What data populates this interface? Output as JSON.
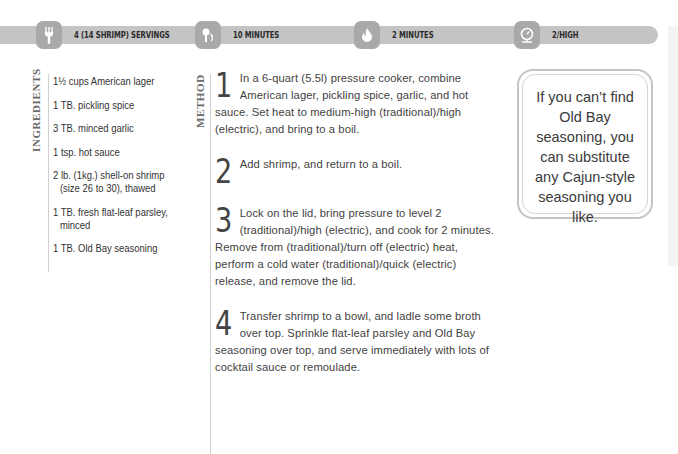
{
  "header": {
    "items": [
      {
        "icon": "fork-icon",
        "label": "4 (14 SHRIMP) SERVINGS"
      },
      {
        "icon": "prep-time-icon",
        "label": "10 MINUTES"
      },
      {
        "icon": "flame-icon",
        "label": "2 MINUTES"
      },
      {
        "icon": "pressure-gauge-icon",
        "label": "2/HIGH"
      }
    ],
    "bar_color": "#c4c4c4",
    "icon_color": "#a9a9a9"
  },
  "ingredients": {
    "heading": "INGREDIENTS",
    "items": [
      {
        "line1": "1½ cups American lager",
        "line2": ""
      },
      {
        "line1": "1 TB. pickling spice",
        "line2": ""
      },
      {
        "line1": "3 TB. minced garlic",
        "line2": ""
      },
      {
        "line1": "1 tsp. hot sauce",
        "line2": ""
      },
      {
        "line1": "2 lb. (1kg.) shell-on shrimp",
        "line2": "(size 26 to 30), thawed"
      },
      {
        "line1": "1 TB. fresh flat-leaf parsley,",
        "line2": "minced"
      },
      {
        "line1": "1 TB. Old Bay seasoning",
        "line2": ""
      }
    ]
  },
  "method": {
    "heading": "METHOD",
    "steps": [
      {
        "number": "1",
        "text": "In a 6-quart (5.5l) pressure cooker, combine American lager, pickling spice, garlic, and hot sauce. Set heat to medium-high (traditional)/high (electric), and bring to a boil."
      },
      {
        "number": "2",
        "text": "Add shrimp, and return to a boil."
      },
      {
        "number": "3",
        "text": "Lock on the lid, bring pressure to level 2 (traditional)/high (electric), and cook for 2 minutes. Remove from (traditional)/turn off (electric) heat, perform a cold water (traditional)/quick (electric) release, and remove the lid."
      },
      {
        "number": "4",
        "text": "Transfer shrimp to a bowl, and ladle some broth over top. Sprinkle flat-leaf parsley and Old Bay seasoning over top, and serve immediately with lots of cocktail sauce or remoulade."
      }
    ]
  },
  "tip": {
    "text": "If you can’t find Old Bay seasoning, you can substitute any Cajun-style seasoning you like."
  }
}
